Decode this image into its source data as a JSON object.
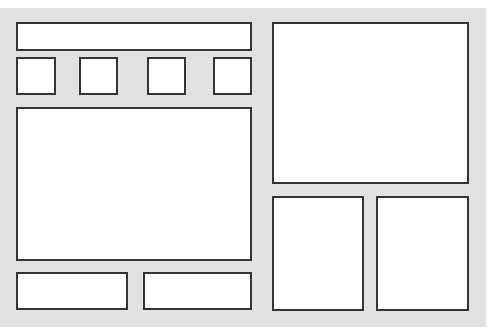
{
  "diagram": {
    "type": "wireframe-layout",
    "background_color": "#e1e1e1",
    "box_fill": "#ffffff",
    "box_stroke": "#333333",
    "boxes": [
      {
        "id": "header-bar",
        "x": 16,
        "y": 22,
        "w": 236,
        "h": 29
      },
      {
        "id": "tile-1",
        "x": 16,
        "y": 57,
        "w": 40,
        "h": 38
      },
      {
        "id": "tile-2",
        "x": 79,
        "y": 57,
        "w": 39,
        "h": 38
      },
      {
        "id": "tile-3",
        "x": 147,
        "y": 57,
        "w": 39,
        "h": 38
      },
      {
        "id": "tile-4",
        "x": 213,
        "y": 57,
        "w": 39,
        "h": 38
      },
      {
        "id": "main-panel",
        "x": 16,
        "y": 107,
        "w": 236,
        "h": 154
      },
      {
        "id": "footer-left",
        "x": 16,
        "y": 272,
        "w": 112,
        "h": 38
      },
      {
        "id": "footer-right",
        "x": 143,
        "y": 272,
        "w": 109,
        "h": 38
      },
      {
        "id": "right-top-panel",
        "x": 272,
        "y": 22,
        "w": 197,
        "h": 162
      },
      {
        "id": "right-bottom-left",
        "x": 272,
        "y": 196,
        "w": 92,
        "h": 115
      },
      {
        "id": "right-bottom-right",
        "x": 376,
        "y": 196,
        "w": 93,
        "h": 115
      }
    ]
  }
}
